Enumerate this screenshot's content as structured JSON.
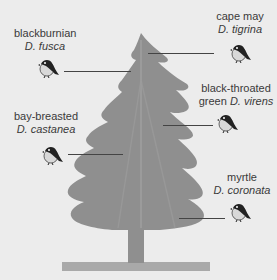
{
  "diagram": {
    "colors": {
      "background": "#ececec",
      "tree": "#8f8f8f",
      "tree_highlight": "#9c9c9c",
      "ground": "#a8a8a8",
      "pointer_line": "#444444"
    },
    "species": [
      {
        "common": "blackburnian",
        "scientific": "D. fusca",
        "icon": "bird-icon"
      },
      {
        "common": "cape may",
        "scientific": "D. tigrina",
        "icon": "bird-icon"
      },
      {
        "common": "black-throated",
        "common2": "green",
        "scientific": "D. virens",
        "icon": "bird-icon"
      },
      {
        "common": "bay-breasted",
        "scientific": "D. castanea",
        "icon": "bird-icon"
      },
      {
        "common": "myrtle",
        "scientific": "D. coronata",
        "icon": "bird-icon"
      }
    ]
  }
}
